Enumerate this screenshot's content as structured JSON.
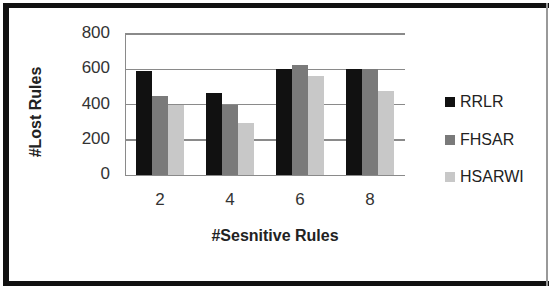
{
  "chart_data": {
    "type": "bar",
    "title": "",
    "xlabel": "#Sesnitive Rules",
    "ylabel": "#Lost Rules",
    "categories": [
      "2",
      "4",
      "6",
      "8"
    ],
    "series": [
      {
        "name": "RRLR",
        "color": "#111111",
        "values": [
          590,
          465,
          600,
          600
        ]
      },
      {
        "name": "FHSAR",
        "color": "#7a7a7a",
        "values": [
          450,
          400,
          625,
          600
        ]
      },
      {
        "name": "HSARWI",
        "color": "#c8c8c8",
        "values": [
          400,
          295,
          560,
          480
        ]
      }
    ],
    "ylim": [
      0,
      800
    ],
    "yticks": [
      "0",
      "200",
      "400",
      "600",
      "800"
    ],
    "grid": true,
    "legend_position": "right"
  }
}
